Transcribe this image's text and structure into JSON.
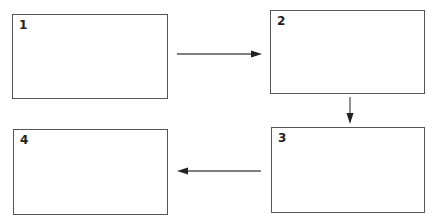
{
  "diagram": {
    "type": "flow",
    "stroke_color": "#555555",
    "arrow_color": "#222222",
    "boxes": [
      {
        "id": "1",
        "label": "1",
        "x": 12,
        "y": 14,
        "w": 156,
        "h": 85
      },
      {
        "id": "2",
        "label": "2",
        "x": 270,
        "y": 10,
        "w": 155,
        "h": 84
      },
      {
        "id": "3",
        "label": "3",
        "x": 271,
        "y": 127,
        "w": 154,
        "h": 86
      },
      {
        "id": "4",
        "label": "4",
        "x": 13,
        "y": 129,
        "w": 155,
        "h": 86
      }
    ],
    "arrows": [
      {
        "from": "1",
        "to": "2",
        "direction": "right"
      },
      {
        "from": "2",
        "to": "3",
        "direction": "down"
      },
      {
        "from": "3",
        "to": "4",
        "direction": "left"
      }
    ]
  }
}
